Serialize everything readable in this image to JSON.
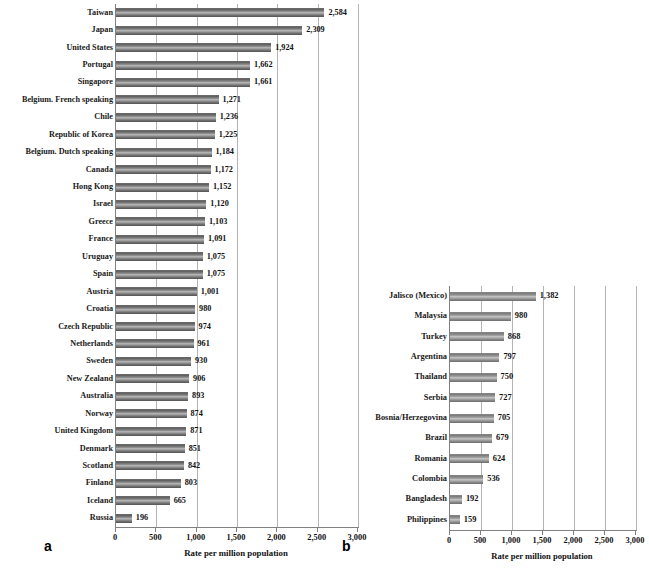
{
  "figure": {
    "panel_a_letter": "a",
    "panel_b_letter": "b"
  },
  "chart_data": [
    {
      "type": "bar",
      "orientation": "horizontal",
      "panel": "a",
      "title": "",
      "xlabel": "Rate per million population",
      "ylabel": "",
      "xlim": [
        0,
        3000
      ],
      "xticks": [
        0,
        500,
        1000,
        1500,
        2000,
        2500,
        3000
      ],
      "xticklabels": [
        "0",
        "500",
        "1,000",
        "1,500",
        "2,000",
        "2,500",
        "3,000"
      ],
      "grid": true,
      "legend": null,
      "categories": [
        "Taiwan",
        "Japan",
        "United States",
        "Portugal",
        "Singapore",
        "Belgium. French speaking",
        "Chile",
        "Republic of Korea",
        "Belgium. Dutch speaking",
        "Canada",
        "Hong Kong",
        "Israel",
        "Greece",
        "France",
        "Uruguay",
        "Spain",
        "Austria",
        "Croatia",
        "Czech Republic",
        "Netherlands",
        "Sweden",
        "New Zealand",
        "Australia",
        "Norway",
        "United Kingdom",
        "Denmark",
        "Scotland",
        "Finland",
        "Iceland",
        "Russia"
      ],
      "values": [
        2584,
        2309,
        1924,
        1662,
        1661,
        1271,
        1236,
        1225,
        1184,
        1172,
        1152,
        1120,
        1103,
        1091,
        1075,
        1075,
        1001,
        980,
        974,
        961,
        930,
        906,
        893,
        874,
        871,
        851,
        842,
        803,
        665,
        196
      ],
      "value_labels": [
        "2,584",
        "2,309",
        "1,924",
        "1,662",
        "1,661",
        "1,271",
        "1,236",
        "1,225",
        "1,184",
        "1,172",
        "1,152",
        "1,120",
        "1,103",
        "1,091",
        "1,075",
        "1,075",
        "1,001",
        "980",
        "974",
        "961",
        "930",
        "906",
        "893",
        "874",
        "871",
        "851",
        "842",
        "803",
        "665",
        "196"
      ]
    },
    {
      "type": "bar",
      "orientation": "horizontal",
      "panel": "b",
      "title": "",
      "xlabel": "Rate per million population",
      "ylabel": "",
      "xlim": [
        0,
        3000
      ],
      "xticks": [
        0,
        500,
        1000,
        1500,
        2000,
        2500,
        3000
      ],
      "xticklabels": [
        "0",
        "500",
        "1,000",
        "1,500",
        "2,000",
        "2,500",
        "3,000"
      ],
      "grid": true,
      "legend": null,
      "categories": [
        "Jalisco (Mexico)",
        "Malaysia",
        "Turkey",
        "Argentina",
        "Thailand",
        "Serbia",
        "Bosnia/Herzegovina",
        "Brazil",
        "Romania",
        "Colombia",
        "Bangladesh",
        "Philippines"
      ],
      "values": [
        1382,
        980,
        868,
        797,
        750,
        727,
        705,
        679,
        624,
        536,
        192,
        159
      ],
      "value_labels": [
        "1,382",
        "980",
        "868",
        "797",
        "750",
        "727",
        "705",
        "679",
        "624",
        "536",
        "192",
        "159"
      ]
    }
  ]
}
